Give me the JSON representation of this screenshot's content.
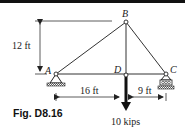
{
  "figure": {
    "caption": "Fig. D8.16"
  },
  "nodes": {
    "A": "A",
    "B": "B",
    "C": "C",
    "D": "D"
  },
  "dimensions": {
    "height": "12 ft",
    "span_AD": "16 ft",
    "span_DC": "9 ft"
  },
  "load": {
    "label": "10 kips"
  },
  "colors": {
    "ink": "#222222",
    "background": "#ffffff"
  }
}
